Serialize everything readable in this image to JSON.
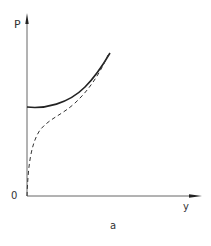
{
  "figure": {
    "caption": "a",
    "axes": {
      "y_label": "P",
      "x_label": "y",
      "origin_label": "0"
    },
    "curves": [
      {
        "name": "solid-curve",
        "style": "solid",
        "description": "starts at finite P on vertical axis, rises with increasing y"
      },
      {
        "name": "dashed-curve",
        "style": "dashed",
        "description": "starts at origin, rises steeply then converges toward solid curve"
      }
    ],
    "colors": {
      "line": "#222222",
      "axis": "#555555",
      "text": "#333333"
    }
  }
}
